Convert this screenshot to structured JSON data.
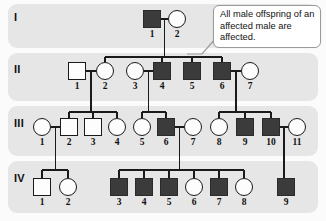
{
  "figure": {
    "colors": {
      "affected_fill": "#3b3b3b",
      "unaffected_fill": "#fdfdfd",
      "band_background": "#e6e6e6",
      "line": "#1a1a1a",
      "callout_border": "#9a9a9a",
      "page_background": "#fbfbfb"
    }
  },
  "callout": {
    "text": "All male offspring of an affected male are affected."
  },
  "generations": [
    {
      "label": "I",
      "individuals": [
        {
          "id": "1",
          "sex": "male",
          "shape": "square",
          "affected": true,
          "x": 143,
          "y": 10
        },
        {
          "id": "2",
          "sex": "female",
          "shape": "circle",
          "affected": false,
          "x": 168,
          "y": 10
        }
      ]
    },
    {
      "label": "II",
      "individuals": [
        {
          "id": "1",
          "sex": "male",
          "shape": "square",
          "affected": false,
          "x": 68,
          "y": 62
        },
        {
          "id": "2",
          "sex": "female",
          "shape": "circle",
          "affected": false,
          "x": 96,
          "y": 62
        },
        {
          "id": "3",
          "sex": "female",
          "shape": "circle",
          "affected": false,
          "x": 126,
          "y": 62
        },
        {
          "id": "4",
          "sex": "male",
          "shape": "square",
          "affected": true,
          "x": 153,
          "y": 62
        },
        {
          "id": "5",
          "sex": "male",
          "shape": "square",
          "affected": true,
          "x": 183,
          "y": 62
        },
        {
          "id": "6",
          "sex": "male",
          "shape": "square",
          "affected": true,
          "x": 213,
          "y": 62
        },
        {
          "id": "7",
          "sex": "female",
          "shape": "circle",
          "affected": false,
          "x": 241,
          "y": 62
        }
      ]
    },
    {
      "label": "III",
      "individuals": [
        {
          "id": "1",
          "sex": "female",
          "shape": "circle",
          "affected": false,
          "x": 33,
          "y": 118
        },
        {
          "id": "2",
          "sex": "male",
          "shape": "square",
          "affected": false,
          "x": 60,
          "y": 118
        },
        {
          "id": "3",
          "sex": "male",
          "shape": "square",
          "affected": false,
          "x": 84,
          "y": 118
        },
        {
          "id": "4",
          "sex": "female",
          "shape": "circle",
          "affected": false,
          "x": 108,
          "y": 118
        },
        {
          "id": "5",
          "sex": "female",
          "shape": "circle",
          "affected": false,
          "x": 133,
          "y": 118
        },
        {
          "id": "6",
          "sex": "male",
          "shape": "square",
          "affected": true,
          "x": 157,
          "y": 118
        },
        {
          "id": "7",
          "sex": "female",
          "shape": "circle",
          "affected": false,
          "x": 184,
          "y": 118
        },
        {
          "id": "8",
          "sex": "female",
          "shape": "circle",
          "affected": false,
          "x": 210,
          "y": 118
        },
        {
          "id": "9",
          "sex": "male",
          "shape": "square",
          "affected": true,
          "x": 236,
          "y": 118
        },
        {
          "id": "10",
          "sex": "male",
          "shape": "square",
          "affected": true,
          "x": 262,
          "y": 118
        },
        {
          "id": "11",
          "sex": "female",
          "shape": "circle",
          "affected": false,
          "x": 288,
          "y": 118
        }
      ]
    },
    {
      "label": "IV",
      "individuals": [
        {
          "id": "1",
          "sex": "male",
          "shape": "square",
          "affected": false,
          "x": 33,
          "y": 178
        },
        {
          "id": "2",
          "sex": "female",
          "shape": "circle",
          "affected": false,
          "x": 59,
          "y": 178
        },
        {
          "id": "3",
          "sex": "male",
          "shape": "square",
          "affected": true,
          "x": 110,
          "y": 178
        },
        {
          "id": "4",
          "sex": "male",
          "shape": "square",
          "affected": true,
          "x": 135,
          "y": 178
        },
        {
          "id": "5",
          "sex": "male",
          "shape": "square",
          "affected": true,
          "x": 160,
          "y": 178
        },
        {
          "id": "6",
          "sex": "female",
          "shape": "circle",
          "affected": false,
          "x": 185,
          "y": 178
        },
        {
          "id": "7",
          "sex": "male",
          "shape": "square",
          "affected": true,
          "x": 210,
          "y": 178
        },
        {
          "id": "8",
          "sex": "female",
          "shape": "circle",
          "affected": false,
          "x": 235,
          "y": 178
        },
        {
          "id": "9",
          "sex": "male",
          "shape": "square",
          "affected": true,
          "x": 277,
          "y": 178
        }
      ]
    }
  ],
  "legend_note": {
    "filled_meaning": "affected",
    "open_meaning": "unaffected",
    "square_meaning": "male",
    "circle_meaning": "female"
  }
}
